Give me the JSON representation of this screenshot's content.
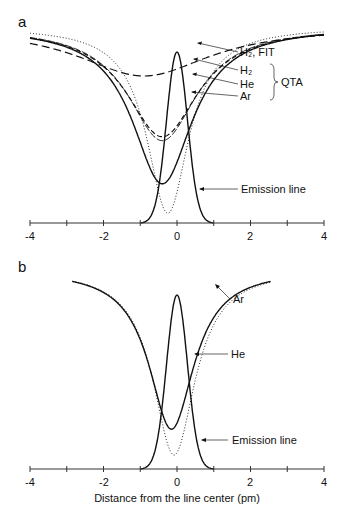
{
  "chart_data": [
    {
      "panel": "a",
      "type": "line",
      "title": "",
      "xlabel": "",
      "ylabel": "",
      "xlim": [
        -4,
        4
      ],
      "xticks": [
        -4,
        -3,
        -2,
        -1,
        0,
        1,
        2,
        3,
        4
      ],
      "xtick_labels": [
        "-4",
        "",
        "-2",
        "",
        "0",
        "",
        "2",
        "",
        "4"
      ],
      "grid": false,
      "series": [
        {
          "name": "H2, FIT",
          "style": "long-dash",
          "center": -0.9,
          "depth": 0.25,
          "width": 2.2
        },
        {
          "name": "H2",
          "group": "QTA",
          "style": "dash",
          "center": -0.4,
          "depth": 0.56,
          "width": 1.2
        },
        {
          "name": "He",
          "group": "QTA",
          "style": "solid-thin",
          "center": -0.4,
          "depth": 0.58,
          "width": 1.15
        },
        {
          "name": "Ar",
          "group": "QTA",
          "style": "solid",
          "center": -0.4,
          "depth": 0.8,
          "width": 1.0
        },
        {
          "name": "dotted reference",
          "style": "dotted",
          "center": -0.25,
          "depth": 0.95,
          "width": 0.7
        },
        {
          "name": "Emission line",
          "style": "solid",
          "center": 0.0,
          "peak": 1.0,
          "width": 0.38
        }
      ],
      "annotations": [
        "H₂, FIT",
        "H₂",
        "He",
        "Ar",
        "QTA",
        "Emission line"
      ]
    },
    {
      "panel": "b",
      "type": "line",
      "title": "",
      "xlabel": "Distance from the line center (pm)",
      "ylabel": "",
      "xlim": [
        -4,
        4
      ],
      "xticks": [
        -4,
        -3,
        -2,
        -1,
        0,
        1,
        2,
        3,
        4
      ],
      "xtick_labels": [
        "-4",
        "",
        "-2",
        "",
        "0",
        "",
        "2",
        "",
        "4"
      ],
      "grid": false,
      "series": [
        {
          "name": "Ar",
          "style": "solid",
          "center": -0.15,
          "depth": 0.8,
          "width": 0.75,
          "x_range": [
            -2.85,
            2.55
          ]
        },
        {
          "name": "He",
          "style": "dotted",
          "center": -0.08,
          "depth": 0.93,
          "width": 0.7,
          "x_range": [
            -2.85,
            2.55
          ]
        },
        {
          "name": "Emission line",
          "style": "solid",
          "center": 0.0,
          "peak": 1.0,
          "width": 0.38
        }
      ],
      "annotations": [
        "Ar",
        "He",
        "Emission line"
      ]
    }
  ],
  "panels": {
    "a": {
      "letter": "a",
      "labels": {
        "h2fit": "H₂, FIT",
        "h2": "H₂",
        "he": "He",
        "ar": "Ar",
        "qta": "QTA",
        "emission": "Emission line"
      },
      "ticks": [
        "-4",
        "-2",
        "0",
        "2",
        "4"
      ]
    },
    "b": {
      "letter": "b",
      "labels": {
        "ar": "Ar",
        "he": "He",
        "emission": "Emission line"
      },
      "ticks": [
        "-4",
        "-2",
        "0",
        "2",
        "4"
      ],
      "xlabel": "Distance from the line center (pm)"
    }
  }
}
